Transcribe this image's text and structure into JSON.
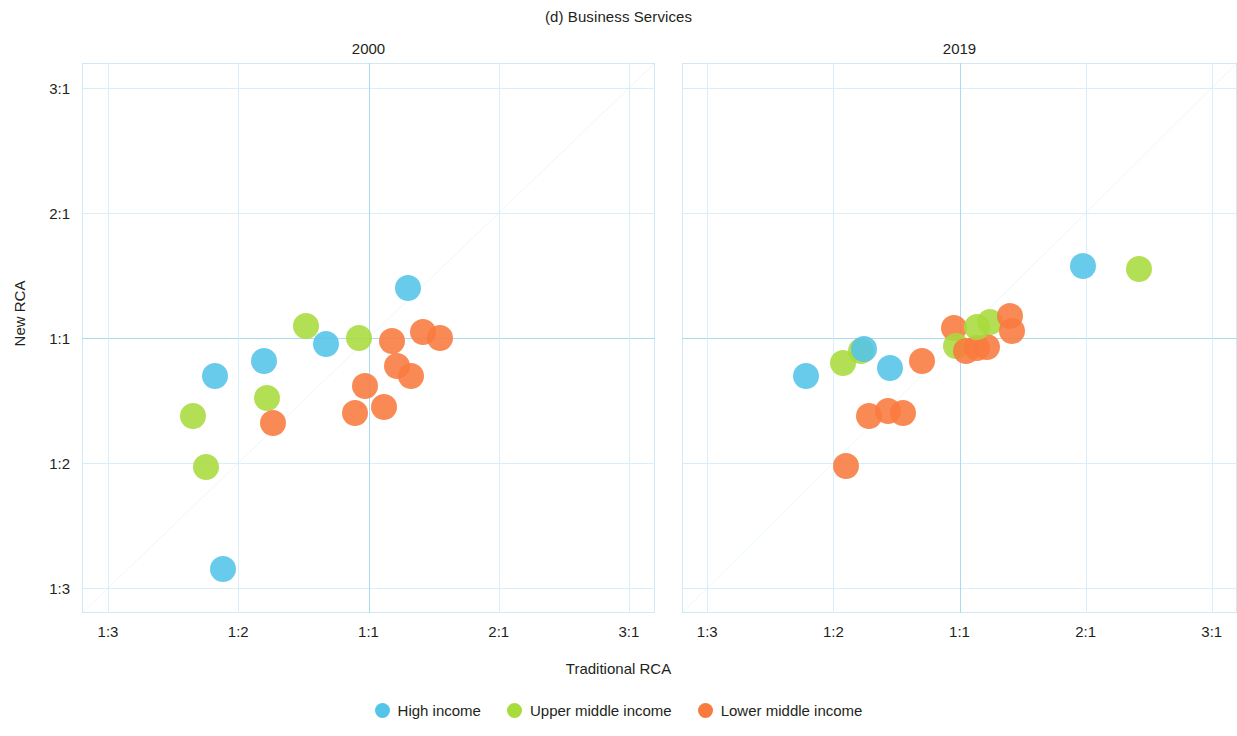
{
  "figure": {
    "title": "(d) Business Services",
    "xlabel": "Traditional RCA",
    "ylabel": "New RCA"
  },
  "legend": {
    "items": [
      {
        "label": "High income",
        "color": "#54C4E9"
      },
      {
        "label": "Upper middle income",
        "color": "#A8DB3C"
      },
      {
        "label": "Lower middle income",
        "color": "#F97A3D"
      }
    ]
  },
  "axes": {
    "xticks": [
      "1:3",
      "1:2",
      "1:1",
      "2:1",
      "3:1"
    ],
    "yticks": [
      "3:1",
      "2:1",
      "1:1",
      "1:2",
      "1:3"
    ],
    "xvalues": [
      -2,
      -1,
      0,
      1,
      2
    ],
    "yvalues": [
      2,
      1,
      0,
      -1,
      -2
    ]
  },
  "chart_data": {
    "type": "scatter",
    "title": "(d) Business Services",
    "xlabel": "Traditional RCA",
    "ylabel": "New RCA",
    "xlim": [
      -2.2,
      2.2
    ],
    "ylim": [
      -2.2,
      2.2
    ],
    "xtick_labels": [
      "1:3",
      "1:2",
      "1:1",
      "2:1",
      "3:1"
    ],
    "ytick_labels": [
      "3:1",
      "2:1",
      "1:1",
      "1:2",
      "1:3"
    ],
    "grid": true,
    "legend_position": "bottom-center",
    "reference_line": {
      "type": "identity",
      "note": "45-degree y = x line",
      "color": "#8ed4ea"
    },
    "panels": [
      {
        "name": "2000",
        "points": [
          {
            "x": -1.35,
            "y": -0.62,
            "group": "Upper middle income",
            "color": "#A8DB3C"
          },
          {
            "x": -1.18,
            "y": -0.3,
            "group": "High income",
            "color": "#54C4E9"
          },
          {
            "x": -1.25,
            "y": -1.03,
            "group": "Upper middle income",
            "color": "#A8DB3C"
          },
          {
            "x": -1.12,
            "y": -1.85,
            "group": "High income",
            "color": "#54C4E9"
          },
          {
            "x": -0.8,
            "y": -0.18,
            "group": "High income",
            "color": "#54C4E9"
          },
          {
            "x": -0.78,
            "y": -0.48,
            "group": "Upper middle income",
            "color": "#A8DB3C"
          },
          {
            "x": -0.73,
            "y": -0.68,
            "group": "Lower middle income",
            "color": "#F97A3D"
          },
          {
            "x": -0.48,
            "y": 0.1,
            "group": "Upper middle income",
            "color": "#A8DB3C"
          },
          {
            "x": -0.33,
            "y": -0.05,
            "group": "High income",
            "color": "#54C4E9"
          },
          {
            "x": -0.07,
            "y": 0.0,
            "group": "Upper middle income",
            "color": "#A8DB3C"
          },
          {
            "x": -0.1,
            "y": -0.6,
            "group": "Lower middle income",
            "color": "#F97A3D"
          },
          {
            "x": -0.03,
            "y": -0.38,
            "group": "Lower middle income",
            "color": "#F97A3D"
          },
          {
            "x": 0.12,
            "y": -0.55,
            "group": "Lower middle income",
            "color": "#F97A3D"
          },
          {
            "x": 0.18,
            "y": -0.02,
            "group": "Lower middle income",
            "color": "#F97A3D"
          },
          {
            "x": 0.22,
            "y": -0.22,
            "group": "Lower middle income",
            "color": "#F97A3D"
          },
          {
            "x": 0.33,
            "y": -0.3,
            "group": "Lower middle income",
            "color": "#F97A3D"
          },
          {
            "x": 0.42,
            "y": 0.05,
            "group": "Lower middle income",
            "color": "#F97A3D"
          },
          {
            "x": 0.55,
            "y": 0.0,
            "group": "Lower middle income",
            "color": "#F97A3D"
          },
          {
            "x": 0.3,
            "y": 0.4,
            "group": "High income",
            "color": "#54C4E9"
          }
        ]
      },
      {
        "name": "2019",
        "points": [
          {
            "x": -1.22,
            "y": -0.3,
            "group": "High income",
            "color": "#54C4E9"
          },
          {
            "x": -0.92,
            "y": -0.2,
            "group": "Upper middle income",
            "color": "#A8DB3C"
          },
          {
            "x": -0.78,
            "y": -0.1,
            "group": "Upper middle income",
            "color": "#A8DB3C"
          },
          {
            "x": -0.76,
            "y": -0.09,
            "group": "High income",
            "color": "#54C4E9"
          },
          {
            "x": -0.9,
            "y": -1.02,
            "group": "Lower middle income",
            "color": "#F97A3D"
          },
          {
            "x": -0.72,
            "y": -0.62,
            "group": "Lower middle income",
            "color": "#F97A3D"
          },
          {
            "x": -0.55,
            "y": -0.24,
            "group": "High income",
            "color": "#54C4E9"
          },
          {
            "x": -0.57,
            "y": -0.58,
            "group": "Lower middle income",
            "color": "#F97A3D"
          },
          {
            "x": -0.45,
            "y": -0.6,
            "group": "Lower middle income",
            "color": "#F97A3D"
          },
          {
            "x": -0.3,
            "y": -0.18,
            "group": "Lower middle income",
            "color": "#F97A3D"
          },
          {
            "x": -0.04,
            "y": 0.08,
            "group": "Lower middle income",
            "color": "#F97A3D"
          },
          {
            "x": -0.03,
            "y": -0.06,
            "group": "Upper middle income",
            "color": "#A8DB3C"
          },
          {
            "x": 0.05,
            "y": -0.1,
            "group": "Lower middle income",
            "color": "#F97A3D"
          },
          {
            "x": 0.14,
            "y": -0.08,
            "group": "Lower middle income",
            "color": "#F97A3D"
          },
          {
            "x": 0.22,
            "y": -0.07,
            "group": "Lower middle income",
            "color": "#F97A3D"
          },
          {
            "x": 0.14,
            "y": 0.09,
            "group": "Upper middle income",
            "color": "#A8DB3C"
          },
          {
            "x": 0.24,
            "y": 0.13,
            "group": "Upper middle income",
            "color": "#A8DB3C"
          },
          {
            "x": 0.4,
            "y": 0.18,
            "group": "Lower middle income",
            "color": "#F97A3D"
          },
          {
            "x": 0.42,
            "y": 0.06,
            "group": "Lower middle income",
            "color": "#F97A3D"
          },
          {
            "x": 0.98,
            "y": 0.58,
            "group": "High income",
            "color": "#54C4E9"
          },
          {
            "x": 1.42,
            "y": 0.55,
            "group": "Upper middle income",
            "color": "#A8DB3C"
          }
        ]
      }
    ]
  }
}
